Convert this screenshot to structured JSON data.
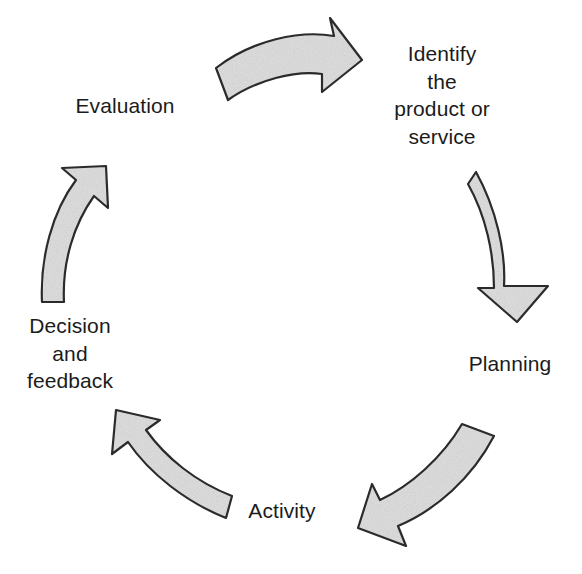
{
  "diagram": {
    "background_color": "#ffffff",
    "arrow_fill_color": "#d8d8d8",
    "arrow_outline_color": "#2b2b2b",
    "text_color": "#1b1b1b",
    "direction": "clockwise",
    "stages": [
      {
        "id": "identify",
        "label": "Identify\nthe\nproduct or\nservice",
        "position": "top-right"
      },
      {
        "id": "planning",
        "label": "Planning",
        "position": "right"
      },
      {
        "id": "activity",
        "label": "Activity",
        "position": "bottom"
      },
      {
        "id": "decision",
        "label": "Decision\nand\nfeedback",
        "position": "bottom-left"
      },
      {
        "id": "evaluation",
        "label": "Evaluation",
        "position": "top-left"
      }
    ],
    "arrows": [
      {
        "id": "arrow-top",
        "from": "evaluation",
        "to": "identify",
        "direction": "right"
      },
      {
        "id": "arrow-right",
        "from": "identify",
        "to": "planning",
        "direction": "down"
      },
      {
        "id": "arrow-bottom-right",
        "from": "planning",
        "to": "activity",
        "direction": "down-left"
      },
      {
        "id": "arrow-bottom-left",
        "from": "activity",
        "to": "decision",
        "direction": "up-left"
      },
      {
        "id": "arrow-left",
        "from": "decision",
        "to": "evaluation",
        "direction": "up"
      }
    ]
  }
}
